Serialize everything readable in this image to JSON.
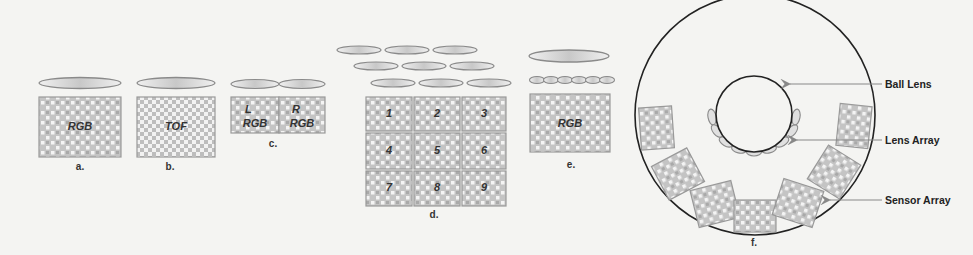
{
  "figure": {
    "colors": {
      "background": "#f4f4f2",
      "stroke": "#888888",
      "dark_stroke": "#222222",
      "sensor_fill": "#c9c9c9",
      "sensor_cell_light": "#f2f2f2",
      "sensor_cell_dark": "#a8a8a8",
      "lens_fill": "#dedede"
    },
    "panels": {
      "a": {
        "caption": "a.",
        "sensor_label": "RGB"
      },
      "b": {
        "caption": "b.",
        "sensor_label": "TOF"
      },
      "c": {
        "caption": "c.",
        "left": {
          "top": "L",
          "bottom": "RGB"
        },
        "right": {
          "top": "R",
          "bottom": "RGB"
        }
      },
      "d": {
        "caption": "d.",
        "cells": [
          "1",
          "2",
          "3",
          "4",
          "5",
          "6",
          "7",
          "8",
          "9"
        ]
      },
      "e": {
        "caption": "e.",
        "sensor_label": "RGB"
      },
      "f": {
        "caption": "f.",
        "callouts": {
          "ball_lens": "Ball Lens",
          "lens_array": "Lens Array",
          "sensor_array": "Sensor Array"
        }
      }
    }
  }
}
